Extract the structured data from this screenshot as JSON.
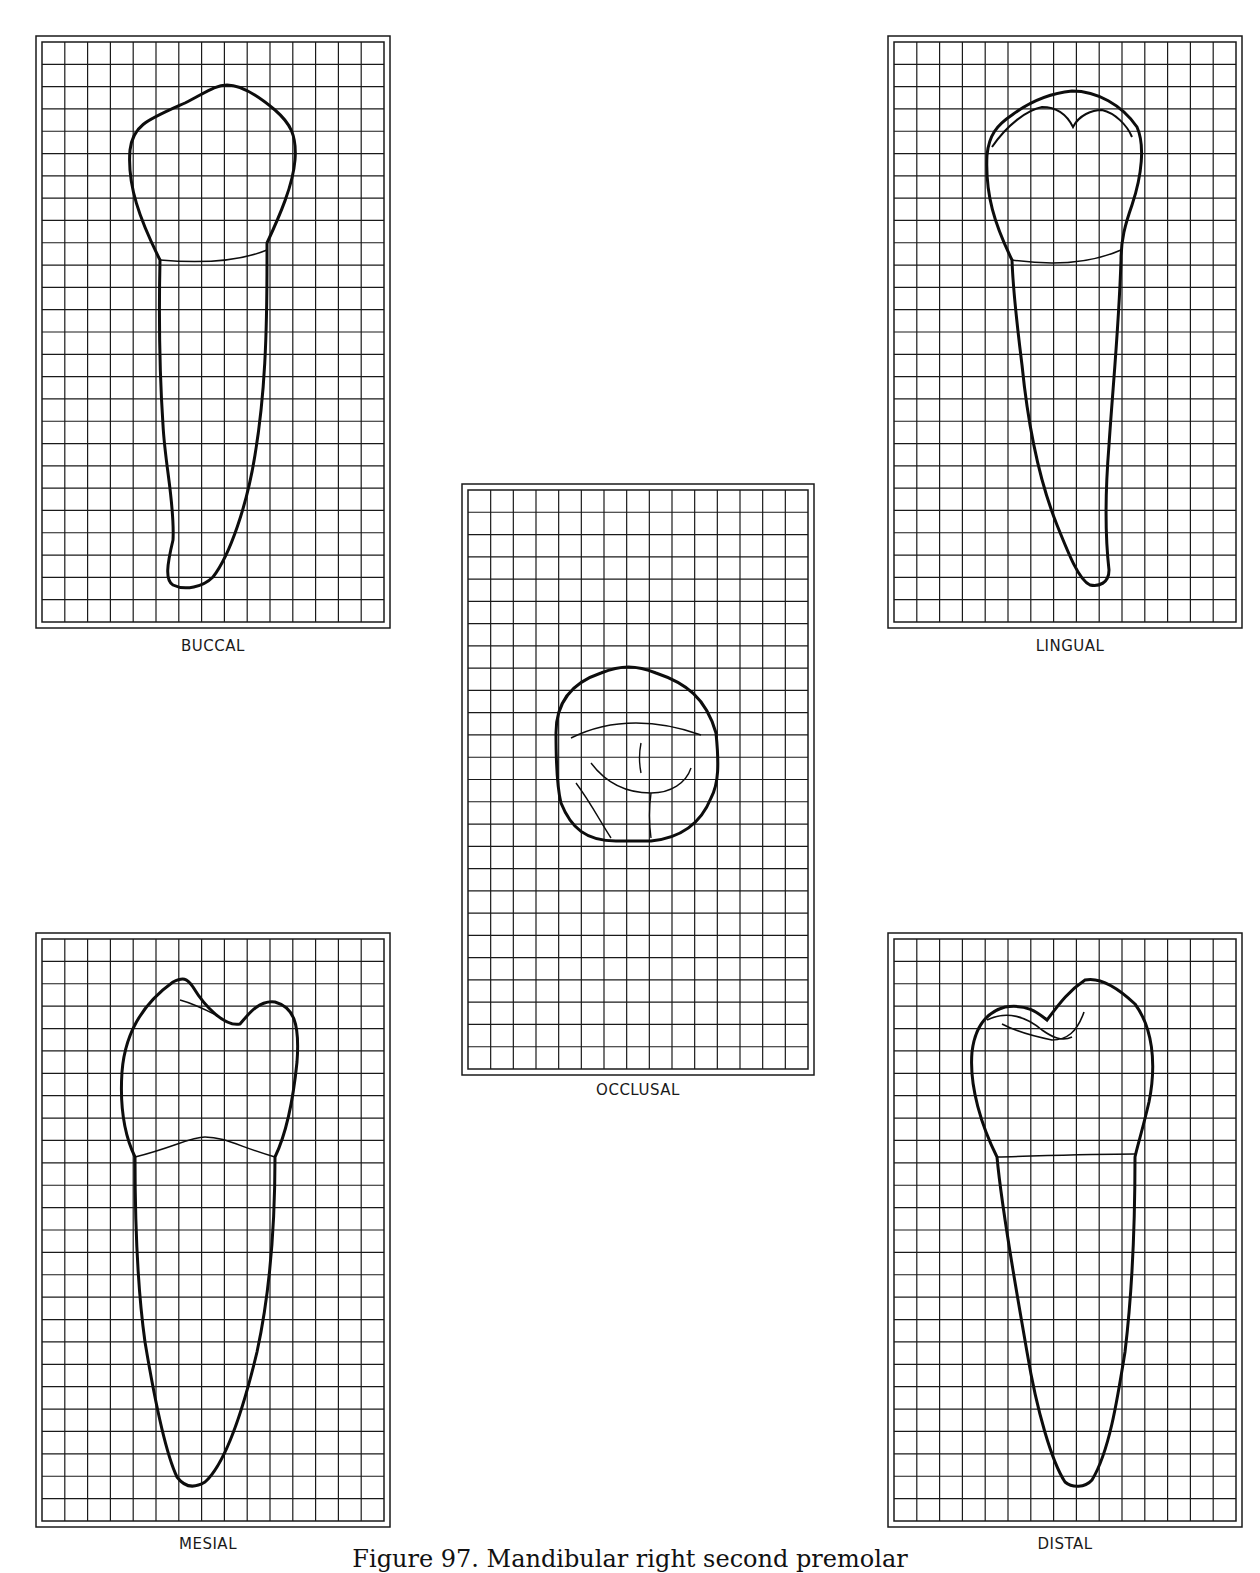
{
  "figure": {
    "caption": "Figure 97. Mandibular right second premolar",
    "grid": {
      "columns": 15,
      "rows": 26,
      "line_color": "#1a1a1a",
      "outline_color": "#0d0d0d"
    }
  },
  "views": [
    {
      "id": "buccal",
      "label": "BUCCAL"
    },
    {
      "id": "lingual",
      "label": "LINGUAL"
    },
    {
      "id": "occlusal",
      "label": "OCCLUSAL"
    },
    {
      "id": "mesial",
      "label": "MESIAL"
    },
    {
      "id": "distal",
      "label": "DISTAL"
    }
  ]
}
